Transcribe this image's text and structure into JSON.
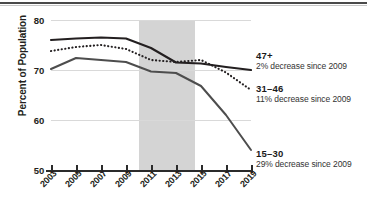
{
  "chart_data": {
    "type": "line",
    "title": "",
    "xlabel": "",
    "ylabel": "Percent of Population",
    "ylim": [
      50,
      80
    ],
    "xlim": [
      2003,
      2019
    ],
    "grid": true,
    "legend_position": "inline-right",
    "y_ticks": [
      "80",
      "70",
      "60",
      "50"
    ],
    "y_tick_values": [
      80,
      70,
      60,
      50
    ],
    "x_ticks": [
      "2003",
      "2005",
      "2007",
      "2009",
      "2011",
      "2013",
      "2015",
      "2017",
      "2019"
    ],
    "x_tick_values": [
      2003,
      2005,
      2007,
      2009,
      2011,
      2013,
      2015,
      2017,
      2019
    ],
    "shaded_band": {
      "start": 2010,
      "end": 2014.5,
      "color": "#d4d4d4"
    },
    "x": [
      2003,
      2005,
      2007,
      2009,
      2011,
      2013,
      2015,
      2017,
      2019
    ],
    "series": [
      {
        "name": "47+",
        "style": "solid-black",
        "color": "#231f20",
        "values": [
          76.0,
          76.3,
          76.5,
          76.3,
          74.4,
          71.5,
          71.3,
          70.6,
          70.0
        ]
      },
      {
        "name": "31–46",
        "style": "dotted",
        "color": "#231f20",
        "values": [
          73.8,
          74.6,
          75.0,
          74.2,
          72.0,
          71.6,
          72.0,
          69.5,
          66.0
        ]
      },
      {
        "name": "15–30",
        "style": "solid-gray-to-black",
        "color": "#4d4d4d",
        "values": [
          70.2,
          72.4,
          72.0,
          71.6,
          69.7,
          69.4,
          66.8,
          61.0,
          54.0
        ]
      }
    ],
    "annotations": [
      {
        "name": "47+",
        "note": "2% decrease since 2009",
        "series": "47+"
      },
      {
        "name": "31–46",
        "note": "11% decrease since 2009",
        "series": "31–46"
      },
      {
        "name": "15–30",
        "note": "29% decrease since 2009",
        "series": "15–30"
      }
    ]
  },
  "axis": {
    "y_title": "Percent of Population"
  }
}
